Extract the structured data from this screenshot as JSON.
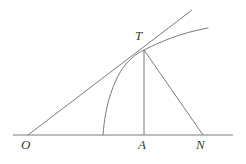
{
  "figure": {
    "background_color": "#ffffff",
    "stroke_color": "#6b6b6b",
    "label_color": "#3a3a3a",
    "width": 246,
    "height": 164
  },
  "labels": {
    "origin": "O",
    "foot": "A",
    "normal_foot": "N",
    "tangent_point": "T"
  },
  "points": {
    "O": {
      "x": 28,
      "y": 135
    },
    "A": {
      "x": 144,
      "y": 135
    },
    "N": {
      "x": 203,
      "y": 135
    },
    "T": {
      "x": 144,
      "y": 50
    },
    "curve_base": {
      "x": 103,
      "y": 135
    },
    "curve_end": {
      "x": 208,
      "y": 28
    },
    "tangent_end": {
      "x": 192,
      "y": 10
    },
    "axis_start": {
      "x": 13,
      "y": 135
    },
    "axis_end": {
      "x": 233,
      "y": 135
    }
  },
  "chart_data": {
    "type": "line",
    "xlabel": "",
    "ylabel": "",
    "grid": false,
    "legend": null,
    "annotations": [
      "O",
      "A",
      "N",
      "T"
    ],
    "series": [
      {
        "name": "axis",
        "kind": "segment",
        "points": [
          [
            13,
            135
          ],
          [
            233,
            135
          ]
        ]
      },
      {
        "name": "tangent-line",
        "kind": "segment",
        "points": [
          [
            28,
            135
          ],
          [
            192,
            10
          ]
        ]
      },
      {
        "name": "ordinate-TA",
        "kind": "segment",
        "points": [
          [
            144,
            50
          ],
          [
            144,
            135
          ]
        ]
      },
      {
        "name": "normal-TN",
        "kind": "segment",
        "points": [
          [
            144,
            50
          ],
          [
            203,
            135
          ]
        ]
      },
      {
        "name": "curve",
        "kind": "curve",
        "points": [
          [
            103,
            135
          ],
          [
            106,
            112
          ],
          [
            112,
            88
          ],
          [
            122,
            70
          ],
          [
            134,
            57
          ],
          [
            144,
            50
          ],
          [
            160,
            41
          ],
          [
            178,
            33
          ],
          [
            208,
            28
          ]
        ]
      }
    ]
  },
  "label_positions": {
    "O": {
      "left": 21,
      "top": 138
    },
    "A": {
      "left": 138,
      "top": 138
    },
    "N": {
      "left": 196,
      "top": 138
    },
    "T": {
      "left": 135,
      "top": 29
    }
  }
}
